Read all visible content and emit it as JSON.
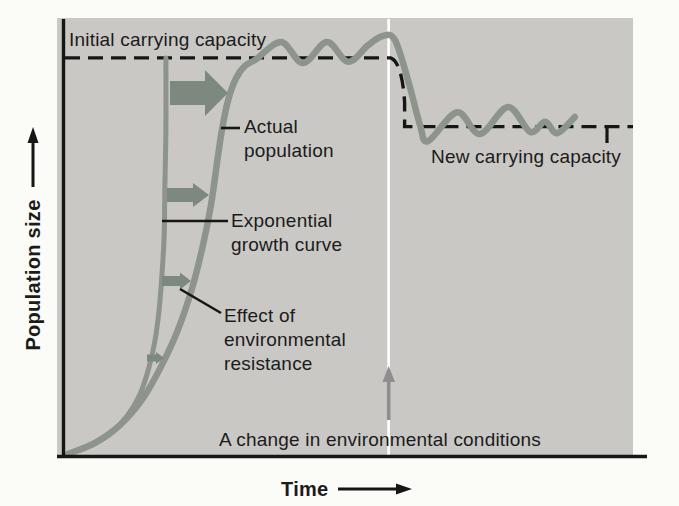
{
  "figure": {
    "background": "#fbfbf8",
    "plot_background": "#c9c8c4",
    "curve_color": "#8d948b",
    "resistance_arrow_color": "#7d897f",
    "change_arrow_color": "#8e8e8e",
    "line_color": "#161616",
    "text_color": "#1b1b1b"
  },
  "labels": {
    "initial_capacity": "Initial carrying capacity",
    "actual_population": "Actual\npopulation",
    "exponential": "Exponential\ngrowth curve",
    "effect": "Effect of\nenvironmental\nresistance",
    "new_capacity": "New carrying capacity",
    "change": "A change in environmental conditions",
    "y_axis": "Population size",
    "x_axis": "Time"
  },
  "chart_data": {
    "type": "line",
    "title": "",
    "xlabel": "Time",
    "ylabel": "Population size",
    "axes_note": "Conceptual axes with no numeric ticks; point values normalized to 0-100 of each axis",
    "grid": false,
    "legend_position": "none (labels annotate curves directly)",
    "series": [
      {
        "name": "Exponential growth curve",
        "points": [
          [
            1.1,
            0.5
          ],
          [
            4.9,
            2.3
          ],
          [
            8.4,
            5.0
          ],
          [
            11.4,
            9.1
          ],
          [
            13.7,
            14.2
          ],
          [
            15.2,
            20.1
          ],
          [
            16.3,
            26.5
          ],
          [
            17.0,
            33.3
          ],
          [
            17.5,
            41.3
          ],
          [
            17.9,
            50.5
          ],
          [
            18.0,
            60.7
          ],
          [
            18.2,
            74.4
          ],
          [
            18.2,
            90.9
          ]
        ]
      },
      {
        "name": "Actual population",
        "points": [
          [
            1.1,
            0.5
          ],
          [
            5.8,
            3.0
          ],
          [
            10.2,
            7.1
          ],
          [
            14.2,
            13.2
          ],
          [
            17.5,
            20.8
          ],
          [
            20.3,
            28.8
          ],
          [
            22.8,
            38.4
          ],
          [
            24.7,
            48.2
          ],
          [
            26.1,
            57.3
          ],
          [
            27.1,
            66.4
          ],
          [
            28.0,
            74.4
          ],
          [
            29.1,
            81.3
          ],
          [
            30.5,
            86.3
          ],
          [
            32.0,
            89.0
          ],
          [
            34.0,
            90.6
          ],
          [
            38.4,
            94.5
          ],
          [
            42.2,
            89.7
          ],
          [
            46.4,
            94.5
          ],
          [
            50.1,
            90.0
          ],
          [
            53.6,
            93.8
          ],
          [
            56.2,
            95.9
          ],
          [
            58.3,
            95.0
          ],
          [
            60.6,
            85.8
          ],
          [
            62.7,
            75.6
          ],
          [
            64.1,
            71.9
          ],
          [
            69.2,
            78.5
          ],
          [
            73.2,
            73.5
          ],
          [
            78.1,
            79.7
          ],
          [
            82.0,
            74.0
          ],
          [
            84.6,
            76.3
          ],
          [
            86.7,
            73.7
          ],
          [
            89.8,
            77.4
          ]
        ]
      }
    ],
    "reference": {
      "initial_carrying_capacity_y": 90.9,
      "new_carrying_capacity_y": 75.2,
      "environmental_change_x": 57.2
    },
    "annotations": [
      "Initial carrying capacity: dashed horizontal line at y=90.9 until the environmental change, then it steps down to the new level",
      "New carrying capacity: dashed horizontal line at y=75.2 after the change, with a small vertical tick near its right end",
      "A change in environmental conditions: white vertical line at x=57.2 with a gray upward arrow",
      "Effect of environmental resistance: four right-pointing block arrows of decreasing size (top to bottom) between the exponential and actual curves"
    ]
  }
}
